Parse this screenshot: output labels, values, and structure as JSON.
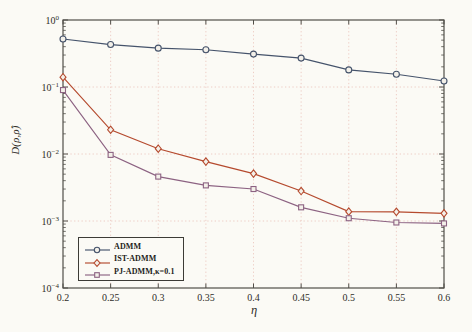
{
  "figure": {
    "background": "#fbfaf5",
    "axis_color": "#504f49",
    "grid_color": "#ecc8c1",
    "text_color": "#2e2d28"
  },
  "chart_data": {
    "type": "line",
    "title": "",
    "xlabel": "η",
    "ylabel": "D(ρ,ρ̂)",
    "xlim": [
      0.2,
      0.6
    ],
    "yscale": "log",
    "ylim": [
      0.0001,
      1
    ],
    "grid": "dotted at major ticks",
    "legend_position": "bottom-left inside axes",
    "xticks": [
      "0.2",
      "0.25",
      "0.3",
      "0.35",
      "0.4",
      "0.45",
      "0.5",
      "0.55",
      "0.6"
    ],
    "ytick_exponents": [
      0,
      -1,
      -2,
      -3,
      -4
    ],
    "x": [
      0.2,
      0.25,
      0.3,
      0.35,
      0.4,
      0.45,
      0.5,
      0.55,
      0.6
    ],
    "series": [
      {
        "name": "ADMM",
        "marker": "circle",
        "color": "#45536b",
        "values": [
          0.52,
          0.43,
          0.38,
          0.36,
          0.31,
          0.27,
          0.18,
          0.155,
          0.123
        ]
      },
      {
        "name": "IST-ADMM",
        "marker": "diamond",
        "color": "#b54a2e",
        "values": [
          0.14,
          0.023,
          0.012,
          0.0077,
          0.0051,
          0.0028,
          0.00138,
          0.00137,
          0.0013
        ]
      },
      {
        "name": "PJ-ADMM,κ=0.1",
        "marker": "square",
        "color": "#8c6282",
        "values": [
          0.09,
          0.0097,
          0.0046,
          0.0034,
          0.003,
          0.0016,
          0.0011,
          0.00095,
          0.00092
        ]
      }
    ]
  }
}
